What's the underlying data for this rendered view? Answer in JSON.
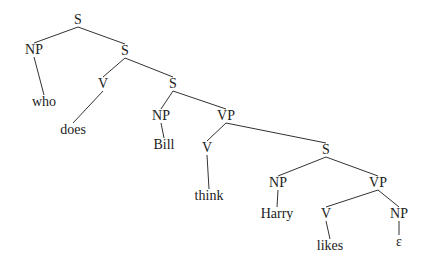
{
  "tree": {
    "nodes": [
      {
        "id": "s1",
        "label": "S",
        "x": 78,
        "y": 20
      },
      {
        "id": "np1",
        "label": "NP",
        "x": 34,
        "y": 50
      },
      {
        "id": "who",
        "label": "who",
        "x": 44,
        "y": 102
      },
      {
        "id": "s2",
        "label": "S",
        "x": 125,
        "y": 51
      },
      {
        "id": "v1",
        "label": "V",
        "x": 103,
        "y": 84
      },
      {
        "id": "does",
        "label": "does",
        "x": 73,
        "y": 130
      },
      {
        "id": "s3",
        "label": "S",
        "x": 173,
        "y": 84
      },
      {
        "id": "np2",
        "label": "NP",
        "x": 161,
        "y": 116
      },
      {
        "id": "bill",
        "label": "Bill",
        "x": 164,
        "y": 145
      },
      {
        "id": "vp1",
        "label": "VP",
        "x": 226,
        "y": 116
      },
      {
        "id": "v2",
        "label": "V",
        "x": 207,
        "y": 148
      },
      {
        "id": "think",
        "label": "think",
        "x": 209,
        "y": 196
      },
      {
        "id": "s4",
        "label": "S",
        "x": 326,
        "y": 150
      },
      {
        "id": "np3",
        "label": "NP",
        "x": 278,
        "y": 183
      },
      {
        "id": "harry",
        "label": "Harry",
        "x": 277,
        "y": 214
      },
      {
        "id": "vp2",
        "label": "VP",
        "x": 378,
        "y": 183
      },
      {
        "id": "v3",
        "label": "V",
        "x": 326,
        "y": 214
      },
      {
        "id": "likes",
        "label": "likes",
        "x": 330,
        "y": 246
      },
      {
        "id": "np4",
        "label": "NP",
        "x": 399,
        "y": 214
      },
      {
        "id": "eps",
        "label": "ε",
        "x": 399,
        "y": 242
      }
    ],
    "edges": [
      [
        "s1",
        "np1"
      ],
      [
        "s1",
        "s2"
      ],
      [
        "np1",
        "who"
      ],
      [
        "s2",
        "v1"
      ],
      [
        "s2",
        "s3"
      ],
      [
        "v1",
        "does"
      ],
      [
        "s3",
        "np2"
      ],
      [
        "s3",
        "vp1"
      ],
      [
        "np2",
        "bill"
      ],
      [
        "vp1",
        "v2"
      ],
      [
        "vp1",
        "s4"
      ],
      [
        "v2",
        "think"
      ],
      [
        "s4",
        "np3"
      ],
      [
        "s4",
        "vp2"
      ],
      [
        "np3",
        "harry"
      ],
      [
        "vp2",
        "v3"
      ],
      [
        "vp2",
        "np4"
      ],
      [
        "v3",
        "likes"
      ],
      [
        "np4",
        "eps"
      ]
    ],
    "line_color": "#333333",
    "text_color": "#222222"
  }
}
